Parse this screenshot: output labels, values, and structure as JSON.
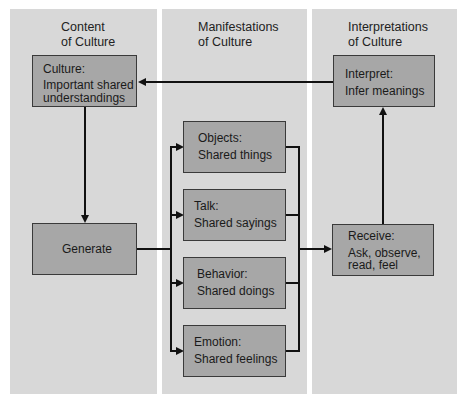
{
  "columns": {
    "content": {
      "title_line1": "Content",
      "title_line2": "of Culture"
    },
    "manifestations": {
      "title_line1": "Manifestations",
      "title_line2": "of Culture"
    },
    "interpretations": {
      "title_line1": "Interpretations",
      "title_line2": "of Culture"
    }
  },
  "boxes": {
    "culture": {
      "label": "Culture:",
      "line1": "Important shared",
      "line2": "understandings"
    },
    "generate": {
      "label": "Generate"
    },
    "objects": {
      "label": "Objects:",
      "line1": "Shared things"
    },
    "talk": {
      "label": "Talk:",
      "line1": "Shared sayings"
    },
    "behavior": {
      "label": "Behavior:",
      "line1": "Shared doings"
    },
    "emotion": {
      "label": "Emotion:",
      "line1": "Shared feelings"
    },
    "receive": {
      "label": "Receive:",
      "line1": "Ask, observe,",
      "line2": "read, feel"
    },
    "interpret": {
      "label": "Interpret:",
      "line1": "Infer meanings"
    }
  },
  "colors": {
    "panel": "#d8d8d8",
    "box": "#a7a7a7",
    "line": "#111111"
  }
}
